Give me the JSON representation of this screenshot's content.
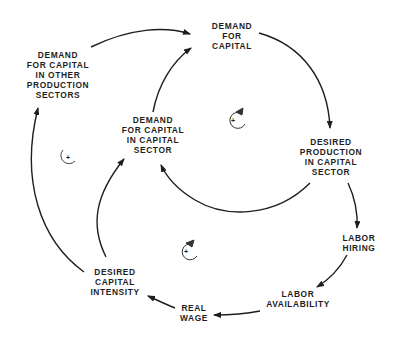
{
  "diagram": {
    "type": "causal-loop",
    "nodes": [
      {
        "id": "demand-for-capital",
        "lines": [
          "DEMAND",
          "FOR",
          "CAPITAL"
        ],
        "x": 232,
        "y": 24
      },
      {
        "id": "demand-other-sectors",
        "lines": [
          "DEMAND",
          "FOR CAPITAL",
          "IN OTHER",
          "PRODUCTION",
          "SECTORS"
        ],
        "x": 58,
        "y": 52
      },
      {
        "id": "demand-capital-sector",
        "lines": [
          "DEMAND",
          "FOR CAPITAL",
          "IN CAPITAL",
          "SECTOR"
        ],
        "x": 153,
        "y": 118
      },
      {
        "id": "desired-production",
        "lines": [
          "DESIRED",
          "PRODUCTION",
          "IN CAPITAL",
          "SECTOR"
        ],
        "x": 331,
        "y": 140
      },
      {
        "id": "labor-hiring",
        "lines": [
          "LABOR",
          "HIRING"
        ],
        "x": 356,
        "y": 233
      },
      {
        "id": "labor-availability",
        "lines": [
          "LABOR",
          "AVAILABILITY"
        ],
        "x": 299,
        "y": 291
      },
      {
        "id": "real-wage",
        "lines": [
          "REAL",
          "WAGE"
        ],
        "x": 195,
        "y": 302
      },
      {
        "id": "desired-capital-intensity",
        "lines": [
          "DESIRED",
          "CAPITAL",
          "INTENSITY"
        ],
        "x": 115,
        "y": 267
      }
    ],
    "links": [
      {
        "from": "demand-other-sectors",
        "to": "demand-for-capital"
      },
      {
        "from": "demand-capital-sector",
        "to": "demand-for-capital"
      },
      {
        "from": "demand-for-capital",
        "to": "desired-production"
      },
      {
        "from": "desired-production",
        "to": "demand-capital-sector"
      },
      {
        "from": "desired-production",
        "to": "labor-hiring"
      },
      {
        "from": "labor-hiring",
        "to": "labor-availability"
      },
      {
        "from": "labor-availability",
        "to": "real-wage"
      },
      {
        "from": "real-wage",
        "to": "desired-capital-intensity"
      },
      {
        "from": "desired-capital-intensity",
        "to": "demand-capital-sector"
      },
      {
        "from": "desired-capital-intensity",
        "to": "demand-other-sectors"
      }
    ],
    "loops": [
      {
        "id": "loop-inner",
        "polarity": "+",
        "x": 233,
        "y": 120
      },
      {
        "id": "loop-left",
        "polarity": "+",
        "x": 67,
        "y": 157
      },
      {
        "id": "loop-bottom",
        "polarity": "+",
        "x": 186,
        "y": 251
      }
    ],
    "line_color": "#1e1e1e"
  }
}
